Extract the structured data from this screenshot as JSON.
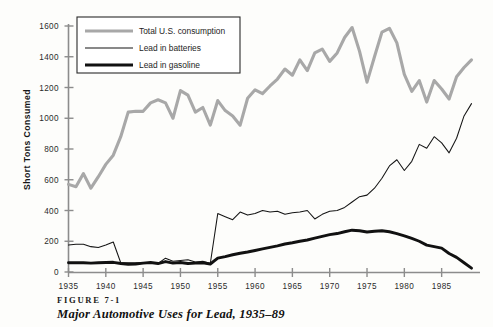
{
  "figure": {
    "number_label": "FIGURE 7-1",
    "title": "Major Automotive Uses for Lead, 1935–89"
  },
  "chart_data": {
    "type": "line",
    "title": "Major Automotive Uses for Lead, 1935–89",
    "xlabel": "",
    "ylabel": "Short Tons Consumed",
    "xlim": [
      1935,
      1989
    ],
    "ylim": [
      0,
      1600
    ],
    "xticks": [
      1935,
      1940,
      1945,
      1950,
      1955,
      1960,
      1965,
      1970,
      1975,
      1980,
      1985
    ],
    "yticks": [
      0,
      200,
      400,
      600,
      800,
      1000,
      1200,
      1400,
      1600
    ],
    "grid": false,
    "legend_position": "top-left",
    "x": [
      1935,
      1936,
      1937,
      1938,
      1939,
      1940,
      1941,
      1942,
      1943,
      1944,
      1945,
      1946,
      1947,
      1948,
      1949,
      1950,
      1951,
      1952,
      1953,
      1954,
      1955,
      1956,
      1957,
      1958,
      1959,
      1960,
      1961,
      1962,
      1963,
      1964,
      1965,
      1966,
      1967,
      1968,
      1969,
      1970,
      1971,
      1972,
      1973,
      1974,
      1975,
      1976,
      1977,
      1978,
      1979,
      1980,
      1981,
      1982,
      1983,
      1984,
      1985,
      1986,
      1987,
      1988,
      1989
    ],
    "series": [
      {
        "name": "Total U.S. consumption",
        "color": "#a8a8a8",
        "width": 3.1,
        "values": [
          570,
          555,
          640,
          545,
          620,
          700,
          760,
          880,
          1040,
          1045,
          1045,
          1100,
          1120,
          1100,
          1000,
          1180,
          1150,
          1040,
          1070,
          955,
          1115,
          1050,
          1015,
          955,
          1130,
          1185,
          1160,
          1210,
          1255,
          1320,
          1280,
          1380,
          1310,
          1425,
          1450,
          1370,
          1425,
          1525,
          1590,
          1435,
          1235,
          1400,
          1560,
          1585,
          1490,
          1285,
          1175,
          1245,
          1105,
          1245,
          1190,
          1125,
          1270,
          1330,
          1380
        ]
      },
      {
        "name": "Lead in batteries",
        "color": "#151515",
        "width": 1.05,
        "values": [
          175,
          180,
          180,
          165,
          160,
          175,
          195,
          60,
          60,
          60,
          60,
          60,
          55,
          90,
          70,
          75,
          80,
          65,
          70,
          55,
          380,
          360,
          340,
          390,
          370,
          380,
          400,
          390,
          395,
          375,
          385,
          390,
          400,
          345,
          375,
          395,
          400,
          420,
          455,
          490,
          500,
          545,
          610,
          690,
          730,
          660,
          720,
          830,
          805,
          880,
          840,
          775,
          870,
          1015,
          1095
        ]
      },
      {
        "name": "Lead in gasoline",
        "color": "#111111",
        "width": 2.9,
        "values": [
          60,
          60,
          60,
          58,
          60,
          62,
          63,
          55,
          50,
          52,
          58,
          62,
          55,
          68,
          58,
          62,
          55,
          58,
          60,
          52,
          90,
          100,
          112,
          122,
          130,
          140,
          150,
          160,
          170,
          182,
          190,
          200,
          208,
          220,
          232,
          243,
          250,
          262,
          272,
          268,
          260,
          265,
          268,
          262,
          250,
          235,
          218,
          200,
          175,
          165,
          155,
          120,
          95,
          60,
          25
        ]
      }
    ]
  },
  "legend": {
    "items": [
      {
        "label": "Total U.S. consumption",
        "swatch": "thick-gray"
      },
      {
        "label": "Lead in batteries",
        "swatch": "thin-black"
      },
      {
        "label": "Lead in gasoline",
        "swatch": "thick-black"
      }
    ]
  },
  "axes": {
    "y_title": "Short Tons Consumed",
    "y_ticklabels": [
      "1600",
      "1400",
      "1200",
      "1000",
      "800",
      "600",
      "400",
      "200",
      "0"
    ],
    "x_ticklabels": [
      "1935",
      "1940",
      "1945",
      "1950",
      "1955",
      "1960",
      "1965",
      "1970",
      "1975",
      "1980",
      "1985"
    ]
  }
}
